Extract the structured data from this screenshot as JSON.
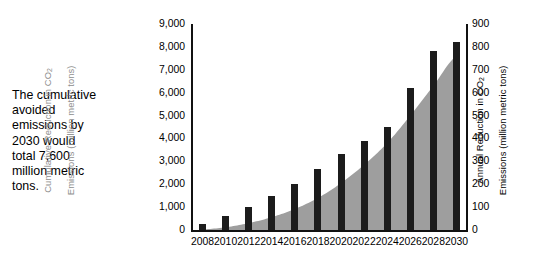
{
  "caption": {
    "text": "The cumulative\navoided\nemissions by\n2030 would\ntotal 7,600\nmillion metric\ntons."
  },
  "colors": {
    "area_fill": "#9e9e9e",
    "bar_fill": "#1c1c1c",
    "left_axis_label": "#8e8e8e",
    "right_axis_label": "#000000",
    "axis_line": "#111111",
    "background": "#ffffff"
  },
  "chart_data": {
    "type": "bar",
    "title": "",
    "xlabel": "",
    "grid": false,
    "legend": "none",
    "x": [
      2008,
      2009,
      2010,
      2011,
      2012,
      2013,
      2014,
      2015,
      2016,
      2017,
      2018,
      2019,
      2020,
      2021,
      2022,
      2023,
      2024,
      2025,
      2026,
      2027,
      2028,
      2029,
      2030
    ],
    "categories": [
      "2008",
      "2010",
      "2012",
      "2014",
      "2016",
      "2018",
      "2020",
      "2022",
      "2024",
      "2026",
      "2028",
      "2030"
    ],
    "xtick_labels": [
      "2008",
      "2010",
      "2012",
      "2014",
      "2016",
      "2018",
      "2020",
      "2022",
      "2024",
      "2026",
      "2028",
      "2030"
    ],
    "xlim": [
      2007,
      2031
    ],
    "left_axis": {
      "label": "Cumulative Reduction in CO2 Emissions (million metric tons)",
      "label_line1": "Cumulative Reduction in CO",
      "label_sub1": "2",
      "label_line2": "Emissions (million metric tons)",
      "ticks": [
        0,
        1000,
        2000,
        3000,
        4000,
        5000,
        6000,
        7000,
        8000,
        9000
      ],
      "tick_labels": [
        "0",
        "1,000",
        "2,000",
        "3,000",
        "4,000",
        "5,000",
        "6,000",
        "7,000",
        "8,000",
        "9,000"
      ],
      "ylim": [
        0,
        9000
      ],
      "color": "#8e8e8e"
    },
    "right_axis": {
      "label": "Annual Reduction in CO2 Emissions (million metric tons)",
      "label_line1": "Annual Reduction in CO",
      "label_sub1": "2",
      "label_line2": "Emissions (million metric tons)",
      "ticks": [
        0,
        100,
        200,
        300,
        400,
        500,
        600,
        700,
        800,
        900
      ],
      "tick_labels": [
        "0",
        "100",
        "200",
        "300",
        "400",
        "500",
        "600",
        "700",
        "800",
        "900"
      ],
      "ylim": [
        0,
        900
      ],
      "color": "#000000"
    },
    "series": [
      {
        "name": "Annual Reduction in CO2 Emissions",
        "type": "bar",
        "axis": "right",
        "units": "million metric tons",
        "x": [
          2008,
          2010,
          2012,
          2014,
          2016,
          2018,
          2020,
          2022,
          2024,
          2026,
          2028,
          2030
        ],
        "values": [
          25,
          60,
          100,
          150,
          200,
          265,
          330,
          390,
          450,
          620,
          780,
          820
        ]
      },
      {
        "name": "Cumulative Reduction in CO2 Emissions",
        "type": "area",
        "axis": "left",
        "units": "million metric tons",
        "x": [
          2008,
          2010,
          2012,
          2014,
          2016,
          2018,
          2020,
          2022,
          2024,
          2026,
          2028,
          2030
        ],
        "values": [
          25,
          120,
          300,
          560,
          920,
          1400,
          2050,
          2850,
          3800,
          5000,
          6300,
          7600
        ]
      }
    ],
    "annotations": [
      "The cumulative avoided emissions by 2030 would total 7,600 million metric tons."
    ]
  }
}
